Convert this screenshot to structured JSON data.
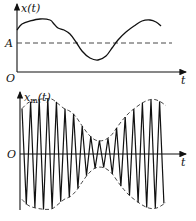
{
  "top_plot": {
    "y_label": "x(t)",
    "x_label": "t",
    "origin_label": "O",
    "level_label": "A",
    "curve": [
      [
        17,
        30
      ],
      [
        22,
        24
      ],
      [
        30,
        21
      ],
      [
        40,
        19
      ],
      [
        50,
        20
      ],
      [
        54,
        24
      ],
      [
        58,
        28
      ],
      [
        64,
        30
      ],
      [
        70,
        34
      ],
      [
        76,
        42
      ],
      [
        82,
        51
      ],
      [
        90,
        58
      ],
      [
        98,
        60
      ],
      [
        106,
        56
      ],
      [
        112,
        48
      ],
      [
        118,
        40
      ],
      [
        126,
        32
      ],
      [
        134,
        26
      ],
      [
        142,
        21
      ],
      [
        150,
        20
      ],
      [
        156,
        22
      ],
      [
        161,
        26
      ]
    ]
  },
  "bottom_plot": {
    "y_label": "x_m(t)",
    "y_label_main": "x",
    "y_label_sub": "m",
    "y_label_arg": "(t)",
    "x_label": "t",
    "origin_label": "O"
  },
  "chart_data": {
    "type": "line",
    "subplots": [
      {
        "title": "",
        "ylabel": "x(t)",
        "xlabel": "t",
        "annotations": [
          "A (dashed reference level)",
          "O (origin)"
        ]
      },
      {
        "title": "",
        "ylabel": "x_m(t)",
        "xlabel": "t",
        "annotations": [
          "amplitude-modulated carrier with dashed envelope ±x(t)",
          "O (origin)"
        ]
      }
    ]
  }
}
